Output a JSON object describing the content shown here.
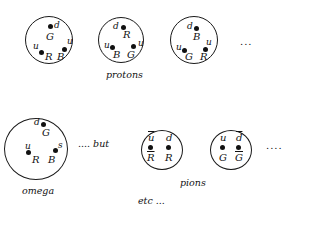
{
  "protons": {
    "caption": "protons",
    "ellipsis": "...",
    "hadrons": [
      {
        "quarks": [
          {
            "flavor": "d",
            "color": "G"
          },
          {
            "flavor": "u",
            "color": "R"
          },
          {
            "flavor": "u",
            "color": "B"
          }
        ]
      },
      {
        "quarks": [
          {
            "flavor": "d",
            "color": "R"
          },
          {
            "flavor": "u",
            "color": "B"
          },
          {
            "flavor": "u",
            "color": "G"
          }
        ]
      },
      {
        "quarks": [
          {
            "flavor": "d",
            "color": "B"
          },
          {
            "flavor": "u",
            "color": "G"
          },
          {
            "flavor": "u",
            "color": "R"
          }
        ]
      }
    ]
  },
  "omega": {
    "caption": "omega",
    "trailing": ".... but",
    "quarks": [
      {
        "flavor": "d",
        "color": "G"
      },
      {
        "flavor": "u",
        "color": "R"
      },
      {
        "flavor": "s",
        "color": "B"
      }
    ]
  },
  "pions": {
    "caption": "pions",
    "ellipsis": "....",
    "hadrons": [
      {
        "quarks": [
          {
            "flavor": "u",
            "color": "R",
            "anti": true
          },
          {
            "flavor": "d",
            "color": "R",
            "anti": false
          }
        ]
      },
      {
        "quarks": [
          {
            "flavor": "u",
            "color": "G",
            "anti": false
          },
          {
            "flavor": "d",
            "color": "G",
            "anti": true
          }
        ]
      }
    ]
  },
  "footer": "etc ..."
}
